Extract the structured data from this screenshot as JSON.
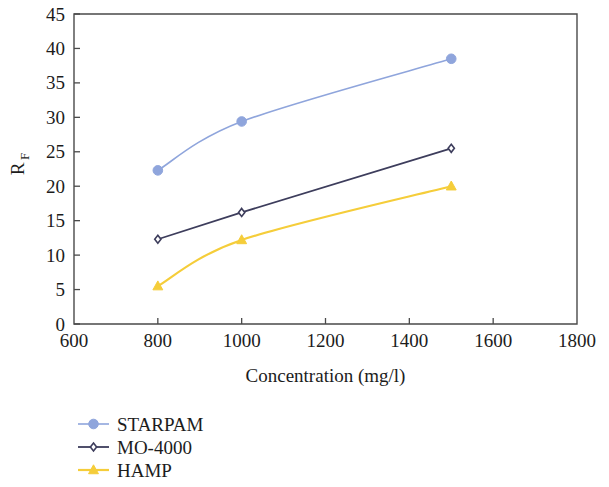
{
  "chart_data": {
    "type": "line",
    "title": "",
    "subtitle": "",
    "xlabel": "Concentration (mg/l)",
    "ylabel": "R",
    "ylabel_subscript": "F",
    "ylabel_full": "RF",
    "x": [
      800,
      1000,
      1500
    ],
    "xlim": [
      600,
      1800
    ],
    "ylim": [
      0,
      45
    ],
    "xticks": [
      600,
      800,
      1000,
      1200,
      1400,
      1600,
      1800
    ],
    "yticks": [
      0,
      5,
      10,
      15,
      20,
      25,
      30,
      35,
      40,
      45
    ],
    "xtick_labels": [
      "600",
      "800",
      "1000",
      "1200",
      "1400",
      "1600",
      "1800"
    ],
    "ytick_labels": [
      "0",
      "5",
      "10",
      "15",
      "20",
      "25",
      "30",
      "35",
      "40",
      "45"
    ],
    "grid": false,
    "legend_position": "below-left",
    "series": [
      {
        "name": "STARPAM",
        "values": [
          22.3,
          29.4,
          38.5
        ],
        "color": "#8fa5dc",
        "marker": "circle",
        "marker_size": 8,
        "line_width": 1.6,
        "smooth": true
      },
      {
        "name": "MO-4000",
        "values": [
          12.3,
          16.2,
          25.5
        ],
        "color": "#3d3d5c",
        "marker": "diamond",
        "marker_size": 7,
        "line_width": 1.8,
        "smooth": false
      },
      {
        "name": "HAMP",
        "values": [
          5.5,
          12.2,
          20.0
        ],
        "color": "#f5cd3a",
        "marker": "triangle",
        "marker_size": 8,
        "line_width": 2.2,
        "smooth": true
      }
    ]
  },
  "legend": {
    "entries": [
      {
        "label": "STARPAM",
        "color": "#8fa5dc",
        "marker": "circle"
      },
      {
        "label": "MO-4000",
        "color": "#3d3d5c",
        "marker": "diamond"
      },
      {
        "label": "HAMP",
        "color": "#f5cd3a",
        "marker": "triangle"
      }
    ]
  },
  "axes": {
    "x_title": "Concentration (mg/l)",
    "y_title_base": "R",
    "y_title_sub": "F"
  },
  "colors": {
    "frame": "#4a4a4a",
    "text": "#1c1c1c",
    "background": "#ffffff",
    "series_starpam": "#8fa5dc",
    "series_mo4000": "#3d3d5c",
    "series_hamp": "#f5cd3a"
  }
}
